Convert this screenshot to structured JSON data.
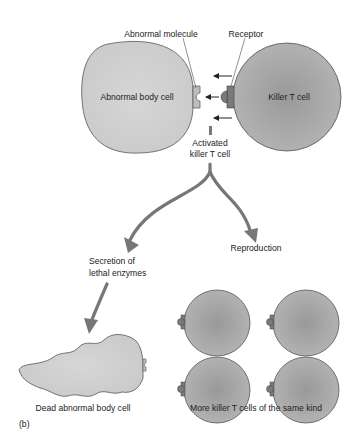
{
  "figure": {
    "panel_label": "(b)",
    "colors": {
      "body_cell_fill": "#d2d2d2",
      "tcell_fill": "#a9a9a9",
      "tcell_center": "#9a9a9a",
      "outline": "#555555",
      "arrow": "#777777",
      "receptor": "#7a7a7a",
      "molecule": "#bdbdbd"
    }
  },
  "labels": {
    "abnormal_molecule": "Abnormal molecule",
    "receptor": "Receptor",
    "abnormal_body_cell": "Abnormal body cell",
    "killer_t_cell": "Killer T cell",
    "activated_line1": "Activated",
    "activated_line2": "killer T cell",
    "secretion_line1": "Secretion of",
    "secretion_line2": "lethal enzymes",
    "reproduction": "Reproduction",
    "dead_cell": "Dead abnormal body cell",
    "more_tcells": "More killer T cells of the same kind"
  }
}
